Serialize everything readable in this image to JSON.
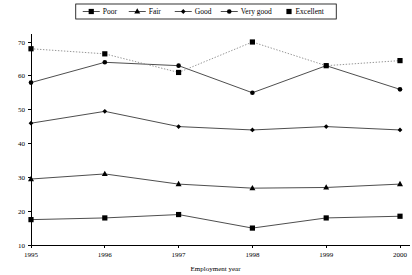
{
  "chart_data": {
    "type": "line",
    "title": "",
    "xlabel": "Employment year",
    "ylabel": "",
    "x": [
      1995,
      1996,
      1997,
      1998,
      1999,
      2000
    ],
    "categories": [
      "1995",
      "1996",
      "1997",
      "1998",
      "1999",
      "2000"
    ],
    "xlim": [
      1995,
      2000
    ],
    "ylim": [
      10,
      70
    ],
    "yticks": [
      10,
      20,
      30,
      40,
      50,
      60,
      70
    ],
    "xticks": [
      "1995",
      "1996",
      "1997",
      "1998",
      "1999",
      "2000"
    ],
    "grid": false,
    "legend_position": "top-center",
    "series": [
      {
        "name": "Poor",
        "marker": "square",
        "linestyle": "solid",
        "color": "#000000",
        "values": [
          17.5,
          18.0,
          19.0,
          15.0,
          18.0,
          18.5
        ]
      },
      {
        "name": "Fair",
        "marker": "triangle",
        "linestyle": "solid",
        "color": "#000000",
        "values": [
          29.5,
          31.0,
          28.0,
          26.8,
          27.0,
          28.0
        ]
      },
      {
        "name": "Good",
        "marker": "diamond",
        "linestyle": "solid",
        "color": "#000000",
        "values": [
          46.0,
          49.5,
          45.0,
          44.0,
          45.0,
          44.0
        ]
      },
      {
        "name": "Very good",
        "marker": "circle",
        "linestyle": "solid",
        "color": "#000000",
        "values": [
          58.0,
          64.0,
          63.0,
          55.0,
          63.0,
          56.0
        ]
      },
      {
        "name": "Excellent",
        "marker": "square",
        "linestyle": "dotted",
        "color": "#000000",
        "values": [
          68.0,
          66.5,
          61.0,
          70.0,
          63.0,
          64.5
        ]
      }
    ]
  }
}
